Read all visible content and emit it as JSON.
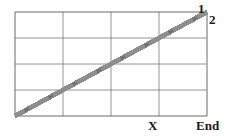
{
  "figure": {
    "type": "billiard-reflection-path-diagram",
    "background_color": "#ffffff",
    "grid": {
      "x0": 15,
      "y0": 12,
      "x1": 207,
      "y1": 116,
      "cols": 4,
      "rows": 4,
      "cell_width": 48,
      "cell_height": 26,
      "line_color": "#7a7a7a",
      "border_color": "#6b6b6b",
      "line_width": 0.8
    },
    "path": {
      "stroke_color": "#8c8c8c",
      "band_offsets": [
        -1.6,
        0,
        1.6
      ],
      "band_width": 0.7,
      "arrow_color": "#6e6e6e",
      "description": "45-degree reflecting ray bouncing between the rectangle walls, drawn as a triple parallel band with small arrowheads along each run"
    }
  },
  "labels": {
    "one": "1",
    "two": "2",
    "x": "X",
    "end": "End"
  }
}
